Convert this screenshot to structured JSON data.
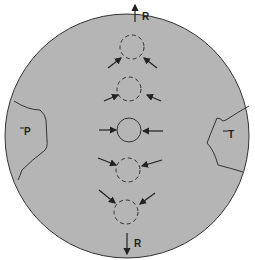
{
  "diagram": {
    "labels": {
      "top_r": "R",
      "bottom_r": "R",
      "p_region": "P",
      "t_region": "T"
    },
    "colors": {
      "disc": "#b5b5b5",
      "stroke": "#333333",
      "background": "#ffffff"
    },
    "circles": [
      {
        "style": "dashed"
      },
      {
        "style": "dashed"
      },
      {
        "style": "solid"
      },
      {
        "style": "dashed"
      },
      {
        "style": "dashed"
      }
    ]
  }
}
